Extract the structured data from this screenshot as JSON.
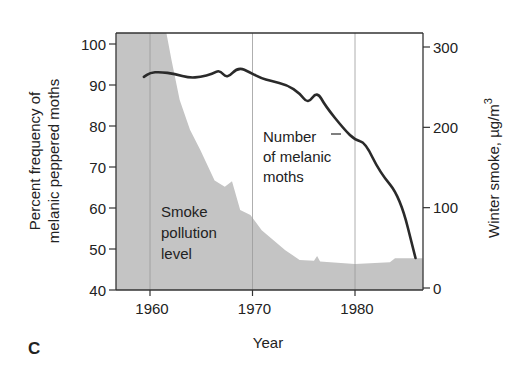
{
  "chart_data": {
    "type": "line",
    "subtype": "dual-axis line over area",
    "panel_label": "C",
    "title": "",
    "xlabel": "Year",
    "ylabel_left": "Percent frequency of melanic peppered moths",
    "ylabel_left_lines": [
      "Percent frequency of",
      "melanic peppered moths"
    ],
    "ylabel_right": "Winter smoke, µg/m3",
    "ylabel_right_parts": {
      "text": "Winter smoke, µg/m",
      "superscript": "3"
    },
    "xlim": [
      1956.7,
      1986.6
    ],
    "ylim_left": [
      40,
      100
    ],
    "ylim_right": [
      0,
      300
    ],
    "x_ticks": [
      1960,
      1970,
      1980
    ],
    "y_ticks_left": [
      40,
      50,
      60,
      70,
      80,
      90,
      100
    ],
    "y_ticks_right": [
      0,
      100,
      200,
      300
    ],
    "grid": {
      "vertical_at": [
        1960,
        1970,
        1980
      ],
      "horizontal": false
    },
    "legend": null,
    "series": [
      {
        "name": "Number of melanic moths",
        "axis": "left",
        "kind": "line",
        "color": "#2a2a2a",
        "x": [
          1959.4,
          1960.0,
          1961.0,
          1962.4,
          1963.9,
          1964.9,
          1966.1,
          1966.8,
          1967.5,
          1968.6,
          1969.8,
          1970.8,
          1971.8,
          1973.4,
          1974.6,
          1975.4,
          1976.3,
          1977.1,
          1979.0,
          1980.0,
          1981.0,
          1982.4,
          1984.4,
          1985.9
        ],
        "values": [
          92.0,
          93.0,
          93.2,
          92.7,
          91.7,
          92.0,
          92.7,
          93.7,
          91.5,
          94.4,
          93.0,
          91.7,
          91.0,
          90.0,
          88.0,
          85.4,
          88.5,
          84.9,
          79.0,
          76.6,
          76.0,
          68.8,
          62.7,
          47.8
        ]
      },
      {
        "name": "Smoke pollution level",
        "axis": "right",
        "kind": "area",
        "color": "#c4c4c4",
        "note": "values at 300+ are clipped at the top of the plot",
        "x": [
          1956.7,
          1961.6,
          1962.1,
          1962.9,
          1963.9,
          1964.9,
          1966.3,
          1967.3,
          1968.0,
          1968.8,
          1969.8,
          1970.9,
          1973.2,
          1974.6,
          1976.0,
          1976.3,
          1976.6,
          1977.6,
          1980.0,
          1983.4,
          1983.9,
          1986.6
        ],
        "values": [
          320,
          320,
          284,
          234,
          197,
          172,
          134,
          126,
          133,
          97,
          91,
          72,
          47,
          35,
          34,
          40,
          33,
          32,
          30,
          32,
          37,
          37
        ]
      }
    ],
    "annotations": [
      {
        "text_lines": [
          "Number",
          "of melanic",
          "moths"
        ],
        "target": "Number of melanic moths",
        "has_pointer": true
      },
      {
        "text_lines": [
          "Smoke",
          "pollution",
          "level"
        ],
        "target": "Smoke pollution level",
        "has_pointer": false
      }
    ]
  },
  "layout": {
    "plot": {
      "left": 116,
      "right": 423,
      "top": 33,
      "bottom": 290
    },
    "x_px_per_year": 10.25,
    "x_ref_year": 1960,
    "x_ref_px": 150,
    "left_axis": {
      "v0": 40,
      "px0": 290,
      "v1": 100,
      "px1": 44
    },
    "right_axis": {
      "v0": 0,
      "px0": 288,
      "v1": 300,
      "px1": 47
    }
  },
  "labels": {
    "x_tick_labels": [
      "1960",
      "1970",
      "1980"
    ],
    "y_left_tick_labels": [
      "40",
      "50",
      "60",
      "70",
      "80",
      "90",
      "100"
    ],
    "y_right_tick_labels": [
      "0",
      "100",
      "200",
      "300"
    ]
  }
}
